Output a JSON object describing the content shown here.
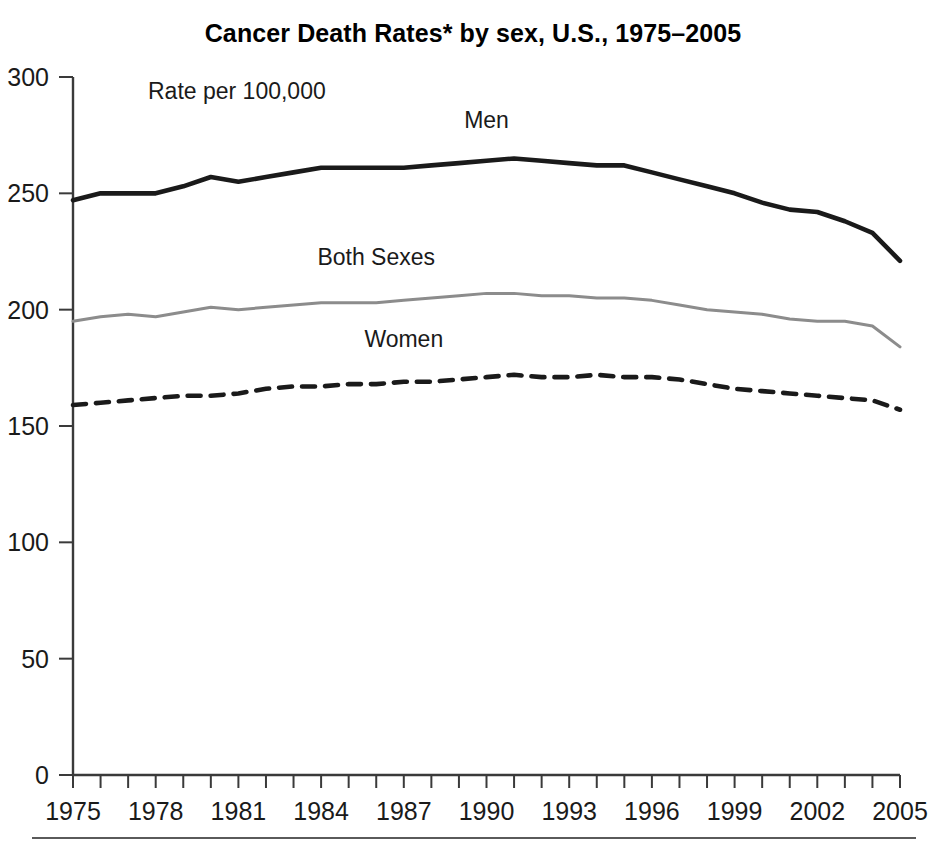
{
  "chart_data": {
    "type": "line",
    "title": "Cancer Death Rates* by sex, U.S., 1975–2005",
    "annotation": "Rate per 100,000",
    "xlabel": "",
    "ylabel": "Rate per 100,000",
    "ylim": [
      0,
      300
    ],
    "xlim": [
      1975,
      2005
    ],
    "yticks": [
      0,
      50,
      100,
      150,
      200,
      250,
      300
    ],
    "xticks": [
      1975,
      1978,
      1981,
      1984,
      1987,
      1990,
      1993,
      1996,
      1999,
      2002,
      2005
    ],
    "xtick_interval_minor": 1,
    "grid": false,
    "legend_position": "inline-labels",
    "x": [
      1975,
      1976,
      1977,
      1978,
      1979,
      1980,
      1981,
      1982,
      1983,
      1984,
      1985,
      1986,
      1987,
      1988,
      1989,
      1990,
      1991,
      1992,
      1993,
      1994,
      1995,
      1996,
      1997,
      1998,
      1999,
      2000,
      2001,
      2002,
      2003,
      2004,
      2005
    ],
    "series": [
      {
        "name": "Men",
        "style": "solid-thick-black",
        "color": "#1a1a1a",
        "label_x": 1990,
        "label_y": 278,
        "values": [
          247,
          250,
          250,
          250,
          253,
          257,
          255,
          257,
          259,
          261,
          261,
          261,
          261,
          262,
          263,
          264,
          265,
          264,
          263,
          262,
          262,
          259,
          256,
          253,
          250,
          246,
          243,
          242,
          238,
          233,
          221
        ]
      },
      {
        "name": "Both Sexes",
        "style": "solid-thin-gray",
        "color": "#8c8c8c",
        "label_x": 1986,
        "label_y": 219,
        "values": [
          195,
          197,
          198,
          197,
          199,
          201,
          200,
          201,
          202,
          203,
          203,
          203,
          204,
          205,
          206,
          207,
          207,
          206,
          206,
          205,
          205,
          204,
          202,
          200,
          199,
          198,
          196,
          195,
          195,
          193,
          184
        ]
      },
      {
        "name": "Women",
        "style": "dashed-black",
        "color": "#1a1a1a",
        "label_x": 1987,
        "label_y": 184,
        "values": [
          159,
          160,
          161,
          162,
          163,
          163,
          164,
          166,
          167,
          167,
          168,
          168,
          169,
          169,
          170,
          171,
          172,
          171,
          171,
          172,
          171,
          171,
          170,
          168,
          166,
          165,
          164,
          163,
          162,
          161,
          157
        ]
      }
    ]
  },
  "footer": {
    "rule": true
  }
}
